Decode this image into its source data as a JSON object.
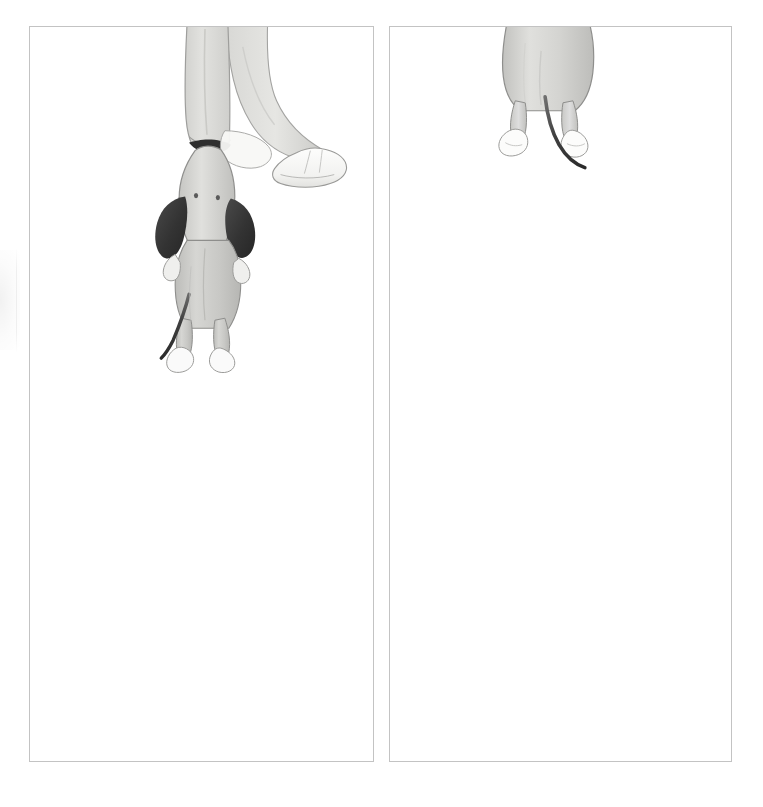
{
  "spread": {
    "kind": "picture-book-double-page-spread",
    "background_color": "#ffffff",
    "page_width": 763,
    "page_height": 807,
    "frame_color": "#c3c3c3"
  },
  "panels": [
    {
      "id": "left",
      "name": "left-illustration-panel",
      "caption": "",
      "frame": {
        "x": 29,
        "y": 26,
        "width": 345,
        "height": 736
      },
      "scene_description": "A child's legs in light grey trousers and white shoes walk in from the top of the frame; a hand at the end of the left trouser leg grips a small grey dog by its dark collar so the dog dangles upside down with long dark ears hanging down.",
      "figures": [
        {
          "name": "child-legs",
          "label": "Child's legs and shoes",
          "trouser_color": "#dcdcda",
          "shoe_color": "#fbfbfa",
          "outline_color": "#9b9b99"
        },
        {
          "name": "hanging-dog",
          "label": "Dog hanging upside down",
          "body_color": "#c9c9c6",
          "ear_color": "#3a3a3a",
          "collar_color": "#2f2f2f",
          "tail_color": "#3d3d3d",
          "paw_color": "#fafafa",
          "eye_color": "#5a5a5a",
          "outline_color": "#8e8e8c"
        }
      ]
    },
    {
      "id": "right",
      "name": "right-illustration-panel",
      "caption": "",
      "frame": {
        "x": 389,
        "y": 26,
        "width": 343,
        "height": 736
      },
      "scene_description": "Only the hindquarters of the same grey dog are visible, entering from the top edge of the frame: two back legs with white paws and a thin dark tail curving down to the right. The rest of the page is empty white space.",
      "figures": [
        {
          "name": "dog-hindquarters",
          "label": "Dog's hind legs and tail",
          "body_color": "#cfcfcc",
          "tail_color": "#3d3d3d",
          "paw_color": "#fcfcfb",
          "outline_color": "#8e8e8c"
        }
      ]
    }
  ],
  "palette": {
    "paper": "#ffffff",
    "frame_rule": "#c3c3c3",
    "dog_body": "#c9c9c6",
    "dog_ear_dark": "#3a3a3a",
    "trousers": "#dcdcda",
    "shoe_white": "#fbfbfa",
    "ink_outline": "#8e8e8c"
  }
}
